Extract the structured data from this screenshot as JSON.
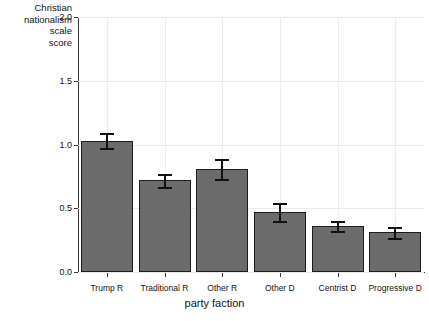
{
  "chart_data": {
    "type": "bar",
    "title": "",
    "subtitle": "",
    "xlabel": "party faction",
    "ylabel": "Christian\nnationalism\nscale\nscore",
    "ylabel_lines": [
      "Christian",
      "nationalism",
      "scale",
      "score"
    ],
    "categories": [
      "Trump R",
      "Traditional R",
      "Other R",
      "Other D",
      "Centrist D",
      "Progressive D"
    ],
    "values": [
      1.03,
      0.72,
      0.81,
      0.47,
      0.36,
      0.31
    ],
    "errors": [
      0.06,
      0.05,
      0.08,
      0.07,
      0.04,
      0.04
    ],
    "ylim": [
      0.0,
      2.0
    ],
    "ytick_labels": [
      "0.0",
      "0.5",
      "1.0",
      "1.5",
      "2.0"
    ],
    "ytick_values": [
      0.0,
      0.5,
      1.0,
      1.5,
      2.0
    ],
    "grid": true,
    "legend": "none",
    "bar_color": "#6b6b6b",
    "bar_edge_color": "#1c1c1c",
    "error_color": "#111111",
    "grid_color": "#e9e9e9",
    "axis_color": "#3a3a3a",
    "background": "#ffffff"
  }
}
